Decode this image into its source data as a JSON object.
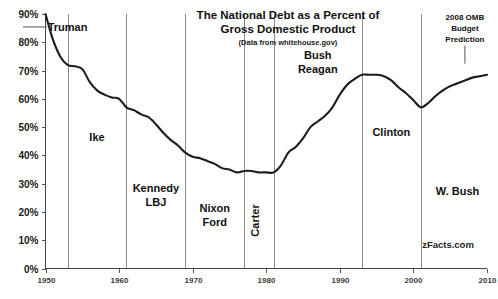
{
  "chart_data": {
    "type": "line",
    "title": "The National Debt as a Percent of Gross Domestic Product",
    "title_line1": "The National Debt as a Percent of",
    "title_line2": "Gross Domestic Product",
    "subtitle": "(Data from whitehouse.gov)",
    "xlabel": "",
    "ylabel": "",
    "xlim": [
      1950,
      2010
    ],
    "ylim": [
      0,
      90
    ],
    "grid": false,
    "legend_position": "none",
    "watermark": "zFacts.com",
    "x_tick_labels": [
      "1950",
      "1960",
      "1970",
      "1980",
      "1990",
      "2000",
      "2010"
    ],
    "x_ticks": [
      1950,
      1960,
      1970,
      1980,
      1990,
      2000,
      2010
    ],
    "y_tick_labels": [
      "0%",
      "10%",
      "20%",
      "30%",
      "40%",
      "50%",
      "60%",
      "70%",
      "80%",
      "90%"
    ],
    "y_ticks": [
      0,
      10,
      20,
      30,
      40,
      50,
      60,
      70,
      80,
      90
    ],
    "series": [
      {
        "name": "Debt as percent of GDP",
        "x": [
          1950,
          1951,
          1952,
          1953,
          1954,
          1955,
          1956,
          1957,
          1958,
          1959,
          1960,
          1961,
          1962,
          1963,
          1964,
          1965,
          1966,
          1967,
          1968,
          1969,
          1970,
          1971,
          1972,
          1973,
          1974,
          1975,
          1976,
          1977,
          1978,
          1979,
          1980,
          1981,
          1982,
          1983,
          1984,
          1985,
          1986,
          1987,
          1988,
          1989,
          1990,
          1991,
          1992,
          1993,
          1994,
          1995,
          1996,
          1997,
          1998,
          1999,
          2000,
          2001,
          2002,
          2003,
          2004,
          2005,
          2006,
          2007,
          2008,
          2009,
          2010
        ],
        "y": [
          90.0,
          81.0,
          75.0,
          72.0,
          71.5,
          70.5,
          66.0,
          63.0,
          61.5,
          60.5,
          60.0,
          57.0,
          56.0,
          54.5,
          53.5,
          51.0,
          48.0,
          45.5,
          43.5,
          41.0,
          39.5,
          39.0,
          38.0,
          37.0,
          35.5,
          35.0,
          34.0,
          34.5,
          34.5,
          34.0,
          34.0,
          34.0,
          36.5,
          41.0,
          43.0,
          46.0,
          50.0,
          52.0,
          54.0,
          57.0,
          61.5,
          65.0,
          67.0,
          68.5,
          68.5,
          68.5,
          68.0,
          66.5,
          64.0,
          62.0,
          59.5,
          57.0,
          58.5,
          61.0,
          63.0,
          64.5,
          65.5,
          66.5,
          67.5,
          68.0,
          68.5
        ]
      }
    ],
    "era_dividers": [
      {
        "year": 1953,
        "label": "Truman-end"
      },
      {
        "year": 1961,
        "label": "Ike-end"
      },
      {
        "year": 1969,
        "label": "Kennedy-LBJ-end"
      },
      {
        "year": 1977,
        "label": "Nixon-Ford-end"
      },
      {
        "year": 1981,
        "label": "Carter-end"
      },
      {
        "year": 1993,
        "label": "Bush-Reagan-end"
      },
      {
        "year": 2001,
        "label": "Clinton-end"
      }
    ],
    "era_labels": [
      {
        "name": "truman",
        "text": "Truman",
        "x": 1953.0,
        "y": 84.0,
        "orientation": "horizontal",
        "leader": true
      },
      {
        "name": "ike",
        "text": "Ike",
        "x": 1957.0,
        "y": 45.0,
        "orientation": "horizontal",
        "leader": false
      },
      {
        "name": "kennedy-lbj",
        "text": "Kennedy\nLBJ",
        "line1": "Kennedy",
        "line2": "LBJ",
        "x": 1965.0,
        "y": 27.0,
        "orientation": "horizontal",
        "leader": false
      },
      {
        "name": "nixon-ford",
        "text": "Nixon\nFord",
        "line1": "Nixon",
        "line2": "Ford",
        "x": 1973.0,
        "y": 20.0,
        "orientation": "horizontal",
        "leader": false
      },
      {
        "name": "carter",
        "text": "Carter",
        "x": 1979.0,
        "y": 17.0,
        "orientation": "vertical",
        "leader": false
      },
      {
        "name": "bush-reagan",
        "text": "Bush\nReagan",
        "line1": "Bush",
        "line2": "Reagan",
        "x": 1987.0,
        "y": 74.0,
        "orientation": "horizontal",
        "leader": false
      },
      {
        "name": "clinton",
        "text": "Clinton",
        "x": 1997.0,
        "y": 47.0,
        "orientation": "horizontal",
        "leader": false
      },
      {
        "name": "w-bush",
        "text": "W. Bush",
        "x": 2006.0,
        "y": 26.0,
        "orientation": "horizontal",
        "leader": false
      }
    ],
    "annotations": [
      {
        "name": "omb-prediction",
        "line1": "2008 OMB",
        "line2": "Budget",
        "line3": "Prediction",
        "x": 2007.0,
        "y": 88.0,
        "leader": true
      }
    ]
  }
}
